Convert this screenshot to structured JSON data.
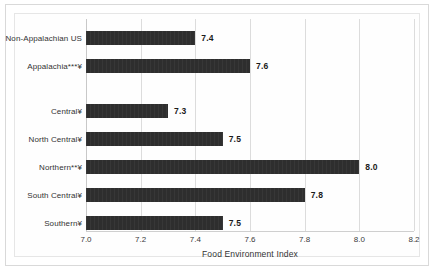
{
  "chart_data": {
    "type": "bar",
    "orientation": "horizontal",
    "title": "",
    "xlabel": "Food Environment Index",
    "ylabel": "",
    "xlim": [
      7.0,
      8.2
    ],
    "xticks": [
      "7.0",
      "7.2",
      "7.4",
      "7.6",
      "7.8",
      "8.0",
      "8.2"
    ],
    "xtick_values": [
      7.0,
      7.2,
      7.4,
      7.6,
      7.8,
      8.0,
      8.2
    ],
    "grid": true,
    "legend": "none",
    "bar_color": "#2e2e2e",
    "categories": [
      "Non-Appalachian US",
      "Appalachia***¥",
      "Central¥",
      "North Central¥",
      "Northern**¥",
      "South Central¥",
      "Southern¥"
    ],
    "values": [
      7.4,
      7.6,
      7.3,
      7.5,
      8.0,
      7.8,
      7.5
    ],
    "value_labels": [
      "7.4",
      "7.6",
      "7.3",
      "7.5",
      "8.0",
      "7.8",
      "7.5"
    ],
    "groups": [
      {
        "name": "comparison",
        "category_indices": [
          0,
          1
        ]
      },
      {
        "name": "appalachian-subregions",
        "category_indices": [
          2,
          3,
          4,
          5,
          6
        ]
      }
    ]
  },
  "axis": {
    "x_title": "Food Environment Index"
  }
}
